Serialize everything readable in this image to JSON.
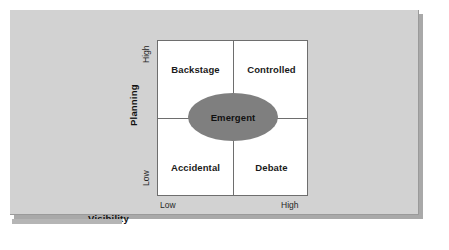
{
  "figure": {
    "background_color": "#d2d2d2",
    "matrix_background": "#ffffff",
    "highlight_color": "#7f7f7f"
  },
  "chart_data": {
    "type": "table",
    "title": "",
    "xlabel": "Visibility",
    "ylabel": "Planning",
    "x_ticks": [
      "Low",
      "High"
    ],
    "y_ticks": [
      "Low",
      "High"
    ],
    "grid": true,
    "legend": null,
    "quadrants": [
      {
        "position": "top-left",
        "label": "Backstage",
        "x": "Low",
        "y": "High"
      },
      {
        "position": "top-right",
        "label": "Controlled",
        "x": "High",
        "y": "High"
      },
      {
        "position": "bottom-left",
        "label": "Accidental",
        "x": "Low",
        "y": "Low"
      },
      {
        "position": "bottom-right",
        "label": "Debate",
        "x": "High",
        "y": "Low"
      }
    ],
    "annotations": [
      {
        "label": "Emergent",
        "shape": "ellipse",
        "x": "center",
        "y": "center",
        "fill": "#7f7f7f"
      }
    ]
  },
  "axes": {
    "y": {
      "title": "Planning",
      "tick_high": "High",
      "tick_low": "Low"
    },
    "x": {
      "title": "Visibility",
      "tick_low": "Low",
      "tick_high": "High"
    }
  },
  "quadrants": {
    "top_left": "Backstage",
    "top_right": "Controlled",
    "bottom_left": "Accidental",
    "bottom_right": "Debate"
  },
  "center": {
    "label": "Emergent"
  }
}
